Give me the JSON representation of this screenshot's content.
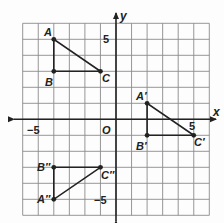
{
  "diagram": {
    "grid": {
      "xmin": -6,
      "xmax": 6,
      "ymin": -6,
      "ymax": 6,
      "grid_color": "#8a8a8a",
      "axis_color": "#222222"
    },
    "axes": {
      "x_label": "x",
      "y_label": "y",
      "origin_label": "O"
    },
    "ticks": [
      {
        "label": "−5",
        "axis": "x",
        "value": -5
      },
      {
        "label": "5",
        "axis": "x",
        "value": 5
      },
      {
        "label": "5",
        "axis": "y",
        "value": 5
      },
      {
        "label": "−5",
        "axis": "y",
        "value": -5
      }
    ],
    "triangles": [
      {
        "name": "ABC",
        "points": [
          {
            "label": "A",
            "x": -4,
            "y": 5
          },
          {
            "label": "B",
            "x": -4,
            "y": 3
          },
          {
            "label": "C",
            "x": -1,
            "y": 3
          }
        ]
      },
      {
        "name": "A'B'C'",
        "points": [
          {
            "label": "A′",
            "x": 2,
            "y": 1
          },
          {
            "label": "B′",
            "x": 2,
            "y": -1
          },
          {
            "label": "C′",
            "x": 5,
            "y": -1
          }
        ]
      },
      {
        "name": "A''B''C''",
        "points": [
          {
            "label": "A″",
            "x": -4,
            "y": -5
          },
          {
            "label": "B″",
            "x": -4,
            "y": -3
          },
          {
            "label": "C″",
            "x": -1,
            "y": -3
          }
        ]
      }
    ]
  }
}
